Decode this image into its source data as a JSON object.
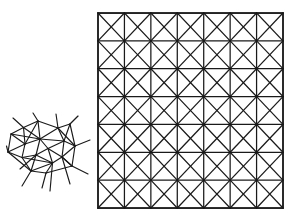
{
  "figure": {
    "background_color": "#ffffff",
    "stroke_color": "#1a1a1a",
    "width": 296,
    "height": 221,
    "caption": ""
  },
  "panels": [
    {
      "id": "irregular-mesh",
      "name": "irregular-graph-mesh",
      "label": "",
      "description": "Irregular wireframe graph drawing with straight-line edges and protruding spikes",
      "bounds": {
        "x": 6,
        "y": 112,
        "width": 86,
        "height": 80
      },
      "stroke_width": 1.15,
      "node_count": 18,
      "edge_count": 44
    },
    {
      "id": "triangulated-grid",
      "name": "triangulated-square-grid",
      "label": "",
      "description": "Square lattice of 7 by 7 cells with both diagonals drawn in every cell",
      "bounds": {
        "x": 98,
        "y": 13,
        "width": 185,
        "height": 195
      },
      "rows": 7,
      "cols": 7,
      "cell_width": 26.43,
      "cell_height": 27.86,
      "stroke_width": 1.25,
      "frame_stroke_width": 1.6,
      "diagonals": "both"
    }
  ],
  "mesh_data": {
    "type": "graph-drawing",
    "nodes": [
      {
        "id": 0,
        "x": 11.0,
        "y": 134.0
      },
      {
        "id": 1,
        "x": 8.0,
        "y": 152.0
      },
      {
        "id": 2,
        "x": 23.5,
        "y": 127.5
      },
      {
        "id": 3,
        "x": 25.0,
        "y": 144.0
      },
      {
        "id": 4,
        "x": 22.0,
        "y": 157.5
      },
      {
        "id": 5,
        "x": 38.0,
        "y": 121.0
      },
      {
        "id": 6,
        "x": 40.0,
        "y": 139.0
      },
      {
        "id": 7,
        "x": 36.0,
        "y": 155.0
      },
      {
        "id": 8,
        "x": 31.0,
        "y": 171.0
      },
      {
        "id": 9,
        "x": 48.0,
        "y": 148.5
      },
      {
        "id": 10,
        "x": 52.5,
        "y": 163.0
      },
      {
        "id": 11,
        "x": 58.0,
        "y": 128.0
      },
      {
        "id": 12,
        "x": 64.0,
        "y": 141.0
      },
      {
        "id": 13,
        "x": 62.0,
        "y": 157.0
      },
      {
        "id": 14,
        "x": 70.0,
        "y": 124.0
      },
      {
        "id": 15,
        "x": 75.0,
        "y": 146.0
      },
      {
        "id": 16,
        "x": 72.0,
        "y": 166.0
      },
      {
        "id": 17,
        "x": 46.0,
        "y": 173.0
      }
    ],
    "edges": [
      [
        0,
        2
      ],
      [
        0,
        3
      ],
      [
        0,
        1
      ],
      [
        1,
        3
      ],
      [
        1,
        4
      ],
      [
        2,
        3
      ],
      [
        2,
        5
      ],
      [
        2,
        6
      ],
      [
        3,
        4
      ],
      [
        3,
        6
      ],
      [
        4,
        7
      ],
      [
        4,
        8
      ],
      [
        5,
        6
      ],
      [
        5,
        11
      ],
      [
        6,
        7
      ],
      [
        6,
        9
      ],
      [
        6,
        11
      ],
      [
        6,
        12
      ],
      [
        7,
        8
      ],
      [
        7,
        9
      ],
      [
        7,
        10
      ],
      [
        8,
        10
      ],
      [
        8,
        17
      ],
      [
        9,
        10
      ],
      [
        9,
        12
      ],
      [
        9,
        13
      ],
      [
        10,
        13
      ],
      [
        10,
        17
      ],
      [
        11,
        12
      ],
      [
        11,
        14
      ],
      [
        12,
        13
      ],
      [
        12,
        14
      ],
      [
        12,
        15
      ],
      [
        13,
        15
      ],
      [
        13,
        16
      ],
      [
        14,
        15
      ],
      [
        15,
        16
      ],
      [
        16,
        13
      ],
      [
        17,
        16
      ],
      [
        5,
        3
      ],
      [
        1,
        8
      ],
      [
        0,
        6
      ],
      [
        11,
        15
      ],
      [
        4,
        10
      ]
    ],
    "spikes": [
      {
        "from": [
          23.5,
          127.5
        ],
        "to": [
          13.0,
          118.0
        ]
      },
      {
        "from": [
          38.0,
          121.0
        ],
        "to": [
          33.0,
          113.0
        ]
      },
      {
        "from": [
          58.0,
          128.0
        ],
        "to": [
          56.0,
          114.0
        ]
      },
      {
        "from": [
          70.0,
          124.0
        ],
        "to": [
          78.0,
          116.0
        ]
      },
      {
        "from": [
          75.0,
          146.0
        ],
        "to": [
          90.0,
          140.0
        ]
      },
      {
        "from": [
          72.0,
          166.0
        ],
        "to": [
          88.0,
          174.0
        ]
      },
      {
        "from": [
          52.5,
          163.0
        ],
        "to": [
          50.0,
          191.0
        ]
      },
      {
        "from": [
          31.0,
          171.0
        ],
        "to": [
          22.0,
          186.0
        ]
      },
      {
        "from": [
          8.0,
          152.0
        ],
        "to": [
          6.5,
          146.0
        ]
      },
      {
        "from": [
          46.0,
          173.0
        ],
        "to": [
          42.0,
          188.0
        ]
      },
      {
        "from": [
          62.0,
          157.0
        ],
        "to": [
          70.0,
          184.0
        ]
      },
      {
        "from": [
          36.0,
          155.0
        ],
        "to": [
          20.0,
          169.0
        ]
      }
    ]
  },
  "grid_data": {
    "type": "lattice",
    "rows": 7,
    "cols": 7,
    "origin": {
      "x": 98,
      "y": 13
    },
    "size": {
      "width": 185,
      "height": 195
    },
    "show_horizontals": true,
    "show_verticals": true,
    "show_diagonal_forward": true,
    "show_diagonal_backward": true,
    "vertex_count": 64,
    "node_marker": false
  }
}
